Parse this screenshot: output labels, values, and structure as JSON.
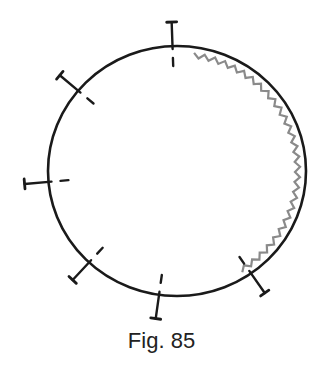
{
  "figure": {
    "caption": "Fig. 85",
    "colors": {
      "circle": "#1a1a1a",
      "wavy_line": "#8a8a8a",
      "background": "#ffffff"
    },
    "circle": {
      "cx": 177,
      "cy": 171,
      "rx": 129,
      "ry": 125
    },
    "markers": [
      {
        "name": "marker-top",
        "angle_deg": -92
      },
      {
        "name": "marker-upper-left",
        "angle_deg": -140
      },
      {
        "name": "marker-left",
        "angle_deg": 175
      },
      {
        "name": "marker-lower-left",
        "angle_deg": 133
      },
      {
        "name": "marker-bottom",
        "angle_deg": 98
      },
      {
        "name": "marker-lower-right",
        "angle_deg": 55
      }
    ],
    "wavy_arc": {
      "start_deg": -82,
      "end_deg": 58
    }
  }
}
